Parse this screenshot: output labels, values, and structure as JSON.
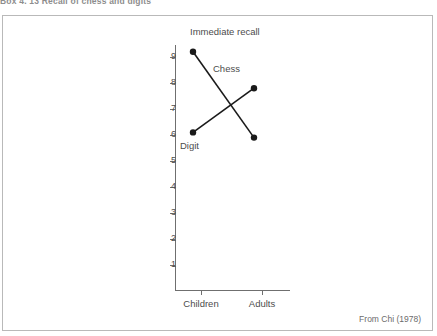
{
  "caption_fragment": "Box 4. 13   Recall of chess and digits",
  "attribution": "From Chi (1978)",
  "chart_data": {
    "type": "line",
    "title": "Immediate recall",
    "xlabel": "",
    "ylabel": "Number of items recalled",
    "categories": [
      "Children",
      "Adults"
    ],
    "ylim": [
      0,
      9.6
    ],
    "yticks": [
      1,
      2,
      3,
      4,
      5,
      6,
      7,
      8,
      9
    ],
    "ytick_labels": [
      "1",
      "2",
      "3",
      "4",
      "5",
      "6",
      "7",
      "8",
      "9"
    ],
    "grid": false,
    "legend_position": "inline-annotation",
    "series": [
      {
        "name": "Chess",
        "values": [
          9.2,
          5.9
        ],
        "color": "#1a1a1a",
        "marker": "filled-circle"
      },
      {
        "name": "Digit",
        "values": [
          6.1,
          7.8
        ],
        "color": "#1a1a1a",
        "marker": "filled-circle"
      }
    ],
    "annotations": [
      {
        "text": "Chess",
        "series": "Chess"
      },
      {
        "text": "Digit",
        "series": "Digit"
      }
    ]
  }
}
